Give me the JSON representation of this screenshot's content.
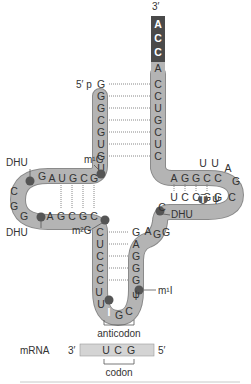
{
  "diagram": {
    "colors": {
      "band": "#b4b4b4",
      "band_edge": "#8a8a8a",
      "cca_box": "#4a4a4a",
      "modified_base": "#555555",
      "text": "#333333"
    },
    "labels": {
      "three_prime_top": "3′",
      "five_prime_p": "5′ p",
      "dhu_top": "DHU",
      "dhu_bottom": "DHU",
      "dhu_right": "DHU",
      "m1g": "m¹G",
      "m2g": "m²G",
      "m1i": "m¹I",
      "anticodon": "anticodon",
      "mrna": "mRNA",
      "mrna_3prime": "3′",
      "mrna_5prime": "5′",
      "codon": "codon"
    },
    "acceptor_3prime_cca": [
      "A",
      "C",
      "C"
    ],
    "acceptor_right_strand": [
      "A",
      "C",
      "C",
      "U",
      "G",
      "C",
      "U",
      "C"
    ],
    "acceptor_left_strand": [
      "G",
      "G",
      "G",
      "C",
      "G",
      "U",
      "G",
      "U"
    ],
    "d_arm": {
      "top_strand": [
        "G",
        "A",
        "U",
        "G",
        "C",
        "G"
      ],
      "bottom_strand": [
        "A",
        "G",
        "C",
        "G",
        "C"
      ],
      "loop": [
        "C",
        "G",
        "G"
      ]
    },
    "t_arm": {
      "top_strand": [
        "A",
        "G",
        "G",
        "C",
        "C",
        "U",
        "U"
      ],
      "bottom_strand": [
        "U",
        "C",
        "C",
        "G",
        "G",
        "T",
        "ψ"
      ],
      "loop": [
        "A",
        "G",
        "C"
      ]
    },
    "variable_loop": [
      "C",
      "A",
      "G",
      "G"
    ],
    "anticodon_arm": {
      "left_strand": [
        "C",
        "U",
        "C",
        "C",
        "C"
      ],
      "right_strand": [
        "G",
        "A",
        "G",
        "G",
        "G"
      ],
      "loop": [
        "U",
        "U",
        "I",
        "G",
        "C",
        "ψ"
      ]
    },
    "mrna_codon": [
      "U",
      "C",
      "G"
    ]
  }
}
